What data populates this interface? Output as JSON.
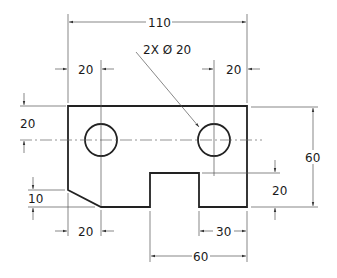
{
  "drawing": {
    "type": "engineering orthographic view",
    "stroke_color": "#222222",
    "part": {
      "overall_width": "110",
      "overall_height": "60",
      "hole_callout": "2X Ø 20",
      "holes": [
        {
          "cx": 101,
          "cy": 140,
          "r": 16
        },
        {
          "cx": 214,
          "cy": 140,
          "r": 16
        }
      ]
    },
    "dimensions": {
      "overall_width": "110",
      "left_hole_offset": "20",
      "right_hole_offset": "20",
      "top_hole_offset": "20",
      "overall_height": "60",
      "slot_depth": "20",
      "chamfer_height": "10",
      "chamfer_width": "20",
      "slot_right_offset": "30",
      "slot_span": "60"
    }
  }
}
